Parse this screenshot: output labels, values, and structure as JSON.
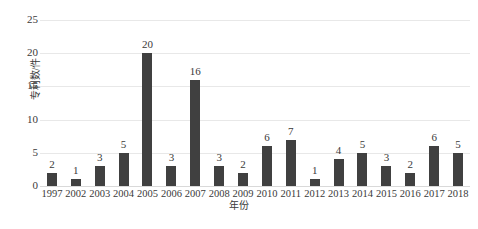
{
  "chart_data": {
    "type": "bar",
    "title": "",
    "xlabel": "年份",
    "ylabel": "专利数/件",
    "categories": [
      "1997",
      "2002",
      "2003",
      "2004",
      "2005",
      "2006",
      "2007",
      "2008",
      "2009",
      "2010",
      "2011",
      "2012",
      "2013",
      "2014",
      "2015",
      "2016",
      "2017",
      "2018"
    ],
    "values": [
      2,
      1,
      3,
      5,
      20,
      3,
      16,
      3,
      2,
      6,
      7,
      1,
      4,
      5,
      3,
      2,
      6,
      5
    ],
    "ylim": [
      0,
      25
    ],
    "yticks": [
      0,
      5,
      10,
      15,
      20,
      25
    ],
    "grid": true,
    "legend": false,
    "bar_color": "#404040",
    "gridline_color": "#e8e8e8",
    "data_labels": [
      "2",
      "1",
      "3",
      "5",
      "20",
      "3",
      "16",
      "3",
      "2",
      "6",
      "7",
      "1",
      "4",
      "5",
      "3",
      "2",
      "6",
      "5"
    ]
  },
  "axis": {
    "y_title": "专利数/件",
    "x_title": "年份",
    "y_tick_labels": [
      "25",
      "20",
      "15",
      "10",
      "5",
      "0"
    ]
  },
  "caption": {
    "text": ""
  }
}
